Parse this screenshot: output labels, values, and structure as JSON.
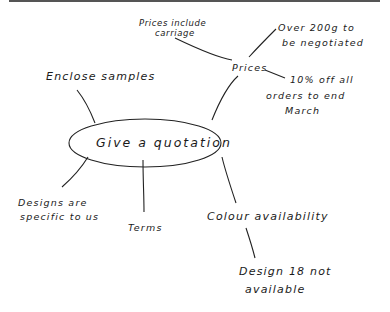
{
  "diagram": {
    "type": "mind-map",
    "center": "Give a quotation",
    "branches": [
      {
        "label": "Prices",
        "children": [
          {
            "label": "Prices include carriage",
            "lines": [
              "Prices include",
              "carriage"
            ]
          },
          {
            "label": "Over 200g to be negotiated",
            "lines": [
              "Over 200g to",
              "be negotiated"
            ]
          },
          {
            "label": "10% off all orders to end March",
            "lines": [
              "10% off all",
              "orders to end",
              "March"
            ]
          }
        ]
      },
      {
        "label": "Enclose samples"
      },
      {
        "label": "Designs are specific to us",
        "lines": [
          "Designs are",
          "specific to us"
        ]
      },
      {
        "label": "Terms"
      },
      {
        "label": "Colour availability",
        "children": [
          {
            "label": "Design 18 not available",
            "lines": [
              "Design 18 not",
              "available"
            ]
          }
        ]
      }
    ]
  }
}
